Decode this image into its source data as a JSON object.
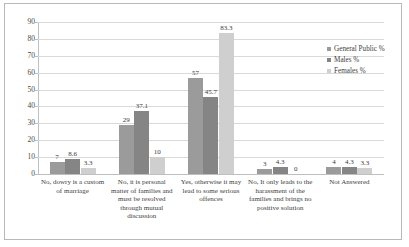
{
  "chart_data": {
    "type": "bar",
    "title": "",
    "subtitle": "",
    "xlabel": "",
    "ylabel": "",
    "ylim": [
      0,
      90
    ],
    "ytick_step": 10,
    "yticks": [
      "0",
      "10",
      "20",
      "30",
      "40",
      "50",
      "60",
      "70",
      "80",
      "90"
    ],
    "grid": true,
    "legend_position": "right-middle",
    "categories": [
      "No, dowry is a custom of marriage",
      "No, it is personal matter of families and must be resolved through mutual discussion",
      "Yes, otherwise it may lead to some serious offences",
      "No, It only leads to the harassment of the families and brings no positive solution",
      "Not Answered"
    ],
    "series": [
      {
        "name": "General Public %",
        "color": "#9b9b9b",
        "values": [
          7,
          29,
          57,
          3,
          4
        ],
        "labels": [
          "7",
          "29",
          "57",
          "3",
          "4"
        ]
      },
      {
        "name": "Males %",
        "color": "#858585",
        "values": [
          8.6,
          37.1,
          45.7,
          4.3,
          4.3
        ],
        "labels": [
          "8.6",
          "37.1",
          "45.7",
          "4.3",
          "4.3"
        ]
      },
      {
        "name": "Females %",
        "color": "#cfcfcf",
        "values": [
          3.3,
          10,
          83.3,
          0,
          3.3
        ],
        "labels": [
          "3.3",
          "10",
          "83.3",
          "0",
          "3.3"
        ]
      }
    ]
  },
  "legend": {
    "items": [
      {
        "label": "General Public %"
      },
      {
        "label": "Males %"
      },
      {
        "label": "Females %"
      }
    ]
  }
}
